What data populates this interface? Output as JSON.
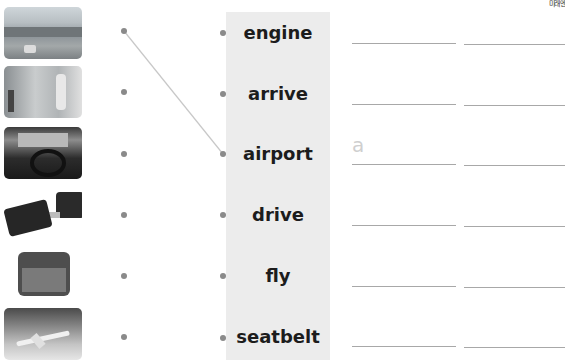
{
  "header": {
    "logo_text": "미래엔"
  },
  "pictures": [
    {
      "name": "airport-photo",
      "desc": "airport"
    },
    {
      "name": "arrive-photo",
      "desc": "arrive"
    },
    {
      "name": "drive-photo",
      "desc": "drive"
    },
    {
      "name": "seatbelt-photo",
      "desc": "seatbelt"
    },
    {
      "name": "engine-photo",
      "desc": "engine"
    },
    {
      "name": "fly-photo",
      "desc": "fly"
    }
  ],
  "words": [
    "engine",
    "arrive",
    "airport",
    "drive",
    "fly",
    "seatbelt"
  ],
  "example": {
    "from_picture": 0,
    "to_word": 2,
    "answer_hint": "a"
  },
  "colors": {
    "panel": "#ececec",
    "dot": "#8a8a8a",
    "line": "#c8c8c8",
    "hint": "#cfcfcf",
    "blank": "#a8a8a8"
  }
}
